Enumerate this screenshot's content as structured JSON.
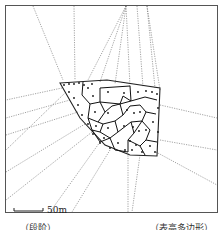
{
  "figure": {
    "scale_label": "50m",
    "captions": {
      "left": "（段阶）",
      "right": "（表高多边形）"
    }
  }
}
